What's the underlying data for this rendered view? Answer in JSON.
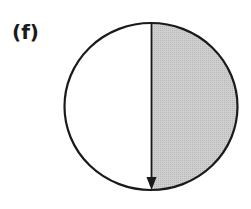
{
  "figure": {
    "label": "(f)",
    "circle": {
      "cx": 151,
      "cy": 106.5,
      "rx": 86.5,
      "ry": 83.5,
      "stroke": "#1a1a1a",
      "fill": "#ffffff"
    },
    "shaded_region": {
      "side": "right",
      "fill": "#c8c8c8"
    },
    "arrow": {
      "x": 151.5,
      "y_start": 23,
      "y_end": 189,
      "direction": "down",
      "color": "#1a1a1a"
    }
  }
}
